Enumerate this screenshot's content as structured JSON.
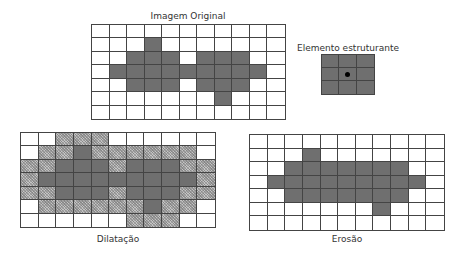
{
  "titles": {
    "original": "Imagem Original",
    "structuring_element": "Elemento estruturante",
    "dilation": "Dilatação",
    "erosion": "Erosão"
  },
  "colors": {
    "foreground": "#6f6f6f",
    "added_by_dilation": "#c4c4c4",
    "background": "#ffffff",
    "grid_line": "#444444"
  },
  "legend": {
    "d": "original foreground pixel (dark gray)",
    "h": "pixel added by dilation (hatched light gray)",
    ".": "background pixel (white)"
  },
  "original_grid": {
    "cols": 11,
    "rows": 7,
    "cells": [
      "...........",
      "...d.......",
      "..ddd.ddd..",
      ".ddddddddd.",
      "..ddd.ddd..",
      ".......d...",
      "..........."
    ]
  },
  "structuring_element": {
    "cols": 3,
    "rows": 3,
    "origin": [
      1,
      1
    ],
    "cells": [
      "ddd",
      "ddd",
      "ddd"
    ]
  },
  "dilation_grid": {
    "cols": 11,
    "rows": 7,
    "cells": [
      "..hhh......",
      ".hhdhhhhhh.",
      "hhdddhdddhh",
      "hdddddddddh",
      "hhdddhdddhh",
      ".hhhhhhdhh.",
      "......hhh.."
    ]
  },
  "erosion_grid": {
    "cols": 11,
    "rows": 7,
    "cells": [
      "...........",
      "...d.......",
      "..ddddddd..",
      ".ddddddddd.",
      "..ddddddd..",
      ".......d...",
      "..........."
    ]
  }
}
